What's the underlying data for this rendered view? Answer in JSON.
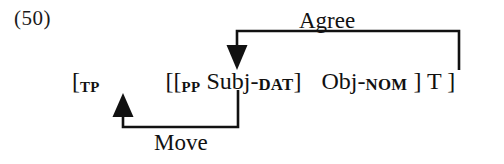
{
  "document": {
    "example_number": "(50)",
    "background_color": "#ffffff",
    "ink_color": "#111111"
  },
  "structure": {
    "segments": [
      {
        "text": "[",
        "style": "normal"
      },
      {
        "text": "TP",
        "style": "subscript"
      },
      {
        "text": "[[",
        "style": "normal"
      },
      {
        "text": "PP",
        "style": "subscript"
      },
      {
        "text": " Subj-",
        "style": "normal"
      },
      {
        "text": "DAT",
        "style": "smallcaps"
      },
      {
        "text": "]",
        "style": "normal"
      },
      {
        "text": "Obj-",
        "style": "normal"
      },
      {
        "text": "NOM",
        "style": "smallcaps"
      },
      {
        "text": " ] T ]",
        "style": "normal"
      }
    ],
    "plain_text": "[TP  [[PP Subj-DAT]  Obj-NOM ] T ]"
  },
  "arrows": [
    {
      "name": "agree-arrow",
      "label": "Agree",
      "direction": "down",
      "from": "T",
      "to": "Subj-DAT",
      "label_position": "above"
    },
    {
      "name": "move-arrow",
      "label": "Move",
      "direction": "up",
      "from": "PP Subj-DAT",
      "to": "TP edge",
      "label_position": "below"
    }
  ]
}
